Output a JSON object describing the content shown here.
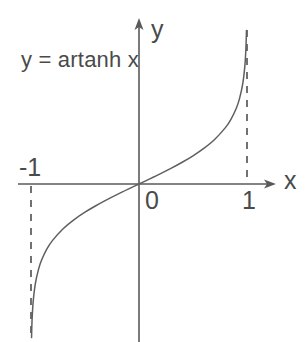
{
  "figure": {
    "background_color": "#ffffff",
    "ink_color": "#4a4a4a",
    "width": 308,
    "height": 342
  },
  "equation_label": "y = artanh x",
  "axes": {
    "x_label": "x",
    "y_label": "y",
    "origin_label": "0",
    "x_ticks": [
      {
        "label": "-1",
        "value": -1
      },
      {
        "label": "0",
        "value": 0
      },
      {
        "label": "1",
        "value": 1
      }
    ],
    "arrow_x": "arrow-right",
    "arrow_y": "arrow-up"
  },
  "asymptotes": [
    {
      "name": "left-asymptote",
      "label": "x = -1",
      "value": -1,
      "style": "dashed"
    },
    {
      "name": "right-asymptote",
      "label": "x = 1",
      "value": 1,
      "style": "dashed"
    }
  ],
  "chart_data": {
    "type": "line",
    "title": "y = artanh x",
    "xlabel": "x",
    "ylabel": "y",
    "xlim": [
      -1.06,
      1.3
    ],
    "ylim": [
      -3.1,
      3.1
    ],
    "grid": false,
    "legend": "none",
    "series": [
      {
        "name": "y = artanh x",
        "x": [
          -0.995,
          -0.99,
          -0.98,
          -0.96,
          -0.93,
          -0.9,
          -0.85,
          -0.8,
          -0.7,
          -0.6,
          -0.5,
          -0.4,
          -0.3,
          -0.2,
          -0.1,
          0.0,
          0.1,
          0.2,
          0.3,
          0.4,
          0.5,
          0.6,
          0.7,
          0.8,
          0.85,
          0.9,
          0.93,
          0.96,
          0.98,
          0.99,
          0.995
        ],
        "y": [
          -2.9945,
          -2.6467,
          -2.2976,
          -1.9459,
          -1.6584,
          -1.4722,
          -1.2562,
          -1.0986,
          -0.8673,
          -0.6931,
          -0.5493,
          -0.4236,
          -0.3095,
          -0.2027,
          -0.1003,
          0.0,
          0.1003,
          0.2027,
          0.3095,
          0.4236,
          0.5493,
          0.6931,
          0.8673,
          1.0986,
          1.2562,
          1.4722,
          1.6584,
          1.9459,
          2.2976,
          2.6467,
          2.9945
        ]
      }
    ],
    "annotations": [
      {
        "text": "y = artanh x",
        "x": -0.95,
        "y": 2.55
      },
      {
        "text": "vertical asymptote at x = -1",
        "x": -1,
        "y": 0
      },
      {
        "text": "vertical asymptote at x = 1",
        "x": 1,
        "y": 0
      }
    ]
  }
}
